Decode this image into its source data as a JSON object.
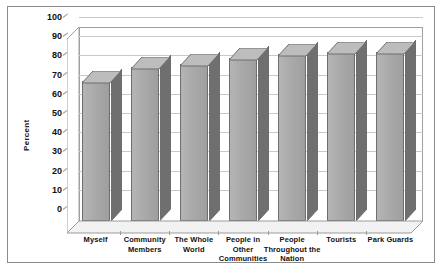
{
  "chart_data": {
    "type": "bar",
    "title": "",
    "subtitle": "",
    "xlabel": "",
    "ylabel": "Percent",
    "ylim": [
      0,
      100
    ],
    "ytick_step": 10,
    "yticks": [
      100,
      90,
      80,
      70,
      60,
      50,
      40,
      30,
      20,
      10,
      0
    ],
    "grid": true,
    "legend": "none",
    "style": "3d-column-grayscale",
    "categories": [
      "Myself",
      "Community Members",
      "The Whole World",
      "People in Other Communities",
      "People Throughout the Nation",
      "Tourists",
      "Park Guards"
    ],
    "category_lines": [
      [
        "Myself"
      ],
      [
        "Community",
        "Members"
      ],
      [
        "The Whole",
        "World"
      ],
      [
        "People in",
        "Other",
        "Communities"
      ],
      [
        "People",
        "Throughout the",
        "Nation"
      ],
      [
        "Tourists"
      ],
      [
        "Park Guards"
      ]
    ],
    "values": [
      73,
      80,
      82,
      85,
      87,
      88,
      88
    ]
  },
  "colors": {
    "bar_front": "#a9a9a9",
    "bar_side": "#6f6f6f",
    "bar_top": "#bdbdbd",
    "bar_outline": "#6e6e6e",
    "gridline": "#c9c9c9",
    "axis": "#9b9b9b",
    "frame_border": "#8a8a8a",
    "text": "#111111",
    "background": "#ffffff"
  }
}
